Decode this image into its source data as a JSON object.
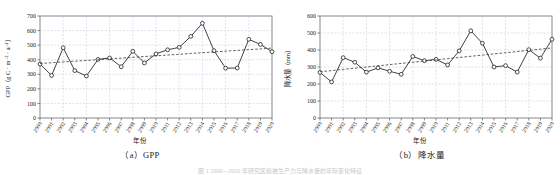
{
  "figure": {
    "panels": [
      {
        "caption": "（a）GPP",
        "xlabel": "年份",
        "ylabel": "GPP（g C · m⁻² · a⁻¹）"
      },
      {
        "caption": "（b）降水量",
        "xlabel": "年份",
        "ylabel": "降水量（mm）"
      }
    ],
    "footer_note": "图 1    2000—2020 年研究区植被生产力与降水量的年际变化特征"
  },
  "chart_data": [
    {
      "type": "line",
      "title": "（a）GPP",
      "xlabel": "年份",
      "ylabel": "GPP（g C · m⁻² · a⁻¹）",
      "grid": true,
      "legend": "none",
      "marker": "open-circle",
      "ylim": [
        0,
        700
      ],
      "yticks": [
        0,
        100,
        200,
        300,
        400,
        500,
        600,
        700
      ],
      "categories": [
        "2000",
        "2001",
        "2002",
        "2003",
        "2004",
        "2005",
        "2006",
        "2007",
        "2008",
        "2009",
        "2010",
        "2011",
        "2012",
        "2013",
        "2014",
        "2015",
        "2016",
        "2017",
        "2018",
        "2019",
        "2020"
      ],
      "series": [
        {
          "name": "GPP",
          "style": "solid-line-open-circle",
          "values": [
            370,
            292,
            482,
            325,
            288,
            402,
            412,
            352,
            458,
            378,
            440,
            468,
            485,
            560,
            650,
            462,
            342,
            343,
            540,
            505,
            455
          ]
        },
        {
          "name": "线性趋势",
          "style": "dashed-trend",
          "values": [
            374,
            379,
            385,
            390,
            395,
            400,
            406,
            411,
            416,
            422,
            427,
            432,
            437,
            443,
            448,
            453,
            459,
            464,
            469,
            474,
            480
          ]
        }
      ]
    },
    {
      "type": "line",
      "title": "（b）降水量",
      "xlabel": "年份",
      "ylabel": "降水量（mm）",
      "grid": true,
      "legend": "none",
      "marker": "open-circle",
      "ylim": [
        0,
        600
      ],
      "yticks": [
        0,
        100,
        200,
        300,
        400,
        500,
        600
      ],
      "categories": [
        "2000",
        "2001",
        "2002",
        "2003",
        "2004",
        "2005",
        "2006",
        "2007",
        "2008",
        "2009",
        "2010",
        "2011",
        "2012",
        "2013",
        "2014",
        "2015",
        "2016",
        "2017",
        "2018",
        "2019",
        "2020"
      ],
      "series": [
        {
          "name": "降水量",
          "style": "solid-line-open-circle",
          "values": [
            268,
            212,
            355,
            328,
            270,
            295,
            275,
            257,
            362,
            337,
            345,
            312,
            395,
            513,
            440,
            300,
            308,
            270,
            402,
            352,
            463
          ]
        },
        {
          "name": "线性趋势",
          "style": "dashed-trend",
          "values": [
            272,
            279,
            286,
            293,
            300,
            307,
            314,
            321,
            328,
            335,
            342,
            349,
            356,
            363,
            370,
            377,
            384,
            391,
            398,
            405,
            412
          ]
        }
      ]
    }
  ],
  "colors": {
    "line": "#2b2b2b",
    "trend": "#3a3a3a",
    "grid": "#b9c3d6",
    "axis": "#555555",
    "text": "#222222"
  }
}
